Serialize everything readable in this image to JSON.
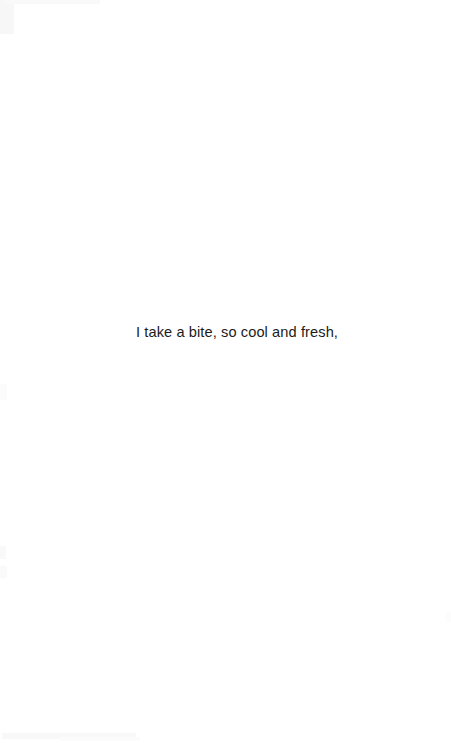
{
  "page": {
    "kind": "scanned-book-page",
    "background_color": "#ffffff",
    "text_color": "#1b1b1b",
    "width": 451,
    "height": 743,
    "body_lines": [
      {
        "text": "I take a bite, so cool and fresh,"
      }
    ]
  }
}
